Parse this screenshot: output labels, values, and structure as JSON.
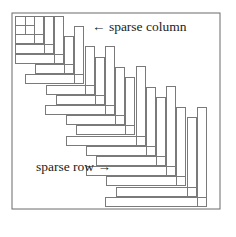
{
  "figure": {
    "frame": {
      "x": 12,
      "y": 13,
      "w": 208,
      "h": 196
    },
    "stroke_color": "#7a7a7a",
    "bar_width": 9,
    "top_left_block": {
      "description": "dense nested blocks in upper-left corner",
      "cells": [
        {
          "x": 15,
          "y": 16,
          "w": 10,
          "h": 9
        },
        {
          "x": 25,
          "y": 16,
          "w": 9,
          "h": 9
        },
        {
          "x": 15,
          "y": 25,
          "w": 10,
          "h": 9
        },
        {
          "x": 25,
          "y": 25,
          "w": 9,
          "h": 9
        }
      ],
      "ells": [
        {
          "cx": 43,
          "cy": 43,
          "h_left": 15,
          "v_top": 16
        },
        {
          "cx": 53,
          "cy": 53,
          "h_left": 15,
          "v_top": 16
        },
        {
          "cx": 63,
          "cy": 63,
          "h_left": 15,
          "v_top": 16
        }
      ]
    },
    "ells": [
      {
        "cx": 73,
        "cy": 73,
        "h_left": 35,
        "v_top": 36
      },
      {
        "cx": 83,
        "cy": 83,
        "h_left": 25,
        "v_top": 26
      },
      {
        "cx": 94,
        "cy": 94,
        "h_left": 46,
        "v_top": 46
      },
      {
        "cx": 104,
        "cy": 104,
        "h_left": 56,
        "v_top": 57
      },
      {
        "cx": 114,
        "cy": 114,
        "h_left": 45,
        "v_top": 46
      },
      {
        "cx": 124,
        "cy": 124,
        "h_left": 66,
        "v_top": 67
      },
      {
        "cx": 134,
        "cy": 134,
        "h_left": 76,
        "v_top": 77
      },
      {
        "cx": 145,
        "cy": 145,
        "h_left": 66,
        "v_top": 66
      },
      {
        "cx": 155,
        "cy": 155,
        "h_left": 86,
        "v_top": 87
      },
      {
        "cx": 165,
        "cy": 165,
        "h_left": 96,
        "v_top": 97
      },
      {
        "cx": 175,
        "cy": 175,
        "h_left": 86,
        "v_top": 86
      },
      {
        "cx": 185,
        "cy": 185,
        "h_left": 106,
        "v_top": 107
      },
      {
        "cx": 196,
        "cy": 196,
        "h_left": 116,
        "v_top": 117
      },
      {
        "cx": 206,
        "cy": 206,
        "h_left": 105,
        "v_top": 107
      }
    ]
  },
  "labels": {
    "sparse_column": "← sparse column",
    "sparse_row": "sparse row →"
  }
}
